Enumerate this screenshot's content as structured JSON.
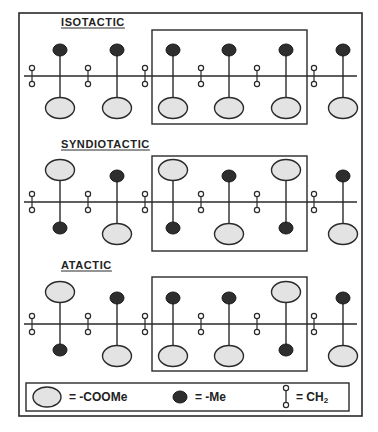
{
  "panels": [
    {
      "title": "ISOTACTIC",
      "title_y": 26,
      "underline_y": 28,
      "backbone_y": 76,
      "box": {
        "x": 152,
        "y": 30,
        "w": 155,
        "h": 94
      },
      "pendants": [
        {
          "up": "Me",
          "down": "COOMe"
        },
        {
          "up": "Me",
          "down": "COOMe"
        },
        {
          "up": "Me",
          "down": "COOMe"
        },
        {
          "up": "Me",
          "down": "COOMe"
        },
        {
          "up": "Me",
          "down": "COOMe"
        },
        {
          "up": "Me",
          "down": "COOMe"
        }
      ]
    },
    {
      "title": "SYNDIOTACTIC",
      "title_y": 148,
      "underline_y": 150,
      "backbone_y": 202,
      "box": {
        "x": 152,
        "y": 156,
        "w": 155,
        "h": 95
      },
      "pendants": [
        {
          "up": "COOMe",
          "down": "Me"
        },
        {
          "up": "Me",
          "down": "COOMe"
        },
        {
          "up": "COOMe",
          "down": "Me"
        },
        {
          "up": "Me",
          "down": "COOMe"
        },
        {
          "up": "COOMe",
          "down": "Me"
        },
        {
          "up": "Me",
          "down": "COOMe"
        }
      ]
    },
    {
      "title": "ATACTIC",
      "title_y": 269,
      "underline_y": 271,
      "backbone_y": 324,
      "box": {
        "x": 152,
        "y": 277,
        "w": 155,
        "h": 94
      },
      "pendants": [
        {
          "up": "COOMe",
          "down": "Me"
        },
        {
          "up": "Me",
          "down": "COOMe"
        },
        {
          "up": "Me",
          "down": "COOMe"
        },
        {
          "up": "Me",
          "down": "COOMe"
        },
        {
          "up": "COOMe",
          "down": "Me"
        },
        {
          "up": "Me",
          "down": "COOMe"
        }
      ]
    }
  ],
  "pendant_x": [
    60,
    117,
    173,
    229,
    286,
    343
  ],
  "ch2_x": [
    32,
    88,
    145,
    201,
    257,
    314
  ],
  "legend": {
    "coome_label": "= -COOMe",
    "me_label": "= -Me",
    "ch2_label": "= CH",
    "ch2_subscript": "2"
  },
  "colors": {
    "line": "#2a2a2a",
    "coome_fill": "#e3e3e3",
    "me_fill": "#2e2e2e",
    "ch2_fill": "#ffffff"
  }
}
